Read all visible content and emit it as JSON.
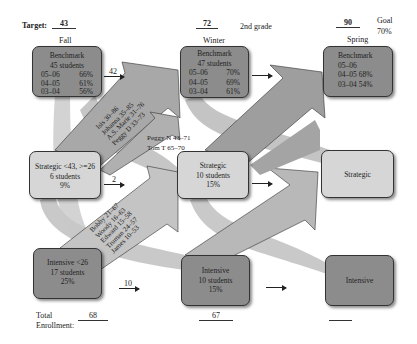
{
  "header": {
    "target_label": "Target:",
    "targets": {
      "fall": "43",
      "winter": "72",
      "spring": "90"
    },
    "grade": "2nd grade",
    "goal_label": "Goal",
    "goal_value": "70%"
  },
  "seasons": {
    "fall": "Fall",
    "winter": "Winter",
    "spring": "Spring"
  },
  "boxes": {
    "fall_benchmark": {
      "title": "Benchmark",
      "students": "45 students",
      "rows": [
        {
          "year": "05–06",
          "pct": "66%"
        },
        {
          "year": "04–05",
          "pct": "61%"
        },
        {
          "year": "03–04",
          "pct": "56%"
        }
      ]
    },
    "winter_benchmark": {
      "title": "Benchmark",
      "students": "47 students",
      "rows": [
        {
          "year": "05–06",
          "pct": "70%"
        },
        {
          "year": "04–05",
          "pct": "69%"
        },
        {
          "year": "03–04",
          "pct": "61%"
        }
      ]
    },
    "spring_benchmark": {
      "title": "Benchmark",
      "rows": [
        {
          "year": "05–06",
          "pct": ""
        },
        {
          "year": "04–05",
          "pct": "68%"
        },
        {
          "year": "03–04",
          "pct": "54%"
        }
      ]
    },
    "fall_strategic": {
      "title": "Strategic <43, >=26",
      "students": "6 students",
      "pct": "9%"
    },
    "winter_strategic": {
      "title": "Strategic",
      "students": "10 students",
      "pct": "15%"
    },
    "spring_strategic": {
      "title": "Strategic"
    },
    "fall_intensive": {
      "title": "Intensive <26",
      "students": "17 students",
      "pct": "25%"
    },
    "winter_intensive": {
      "title": "Intensive",
      "students": "10 students",
      "pct": "15%"
    },
    "spring_intensive": {
      "title": "Intensive"
    }
  },
  "flows": {
    "benchmark_stay": "42",
    "strategic_stay": "2",
    "intensive_stay": "10",
    "strategic_to_benchmark": [
      "Isis 30–86",
      "Johanna 35–85",
      "A.S. Marie 31–76",
      "Peggy D 33–73"
    ],
    "strategic_to_strategic": [
      "Peggy N 43–71",
      "Tom T 65–70"
    ],
    "intensive_to_strategic": [
      "Bobby 21–67",
      "Woody 16–63",
      "Edward 15–58",
      "Truman 24–57",
      "James 10–53"
    ]
  },
  "footer": {
    "total_label_1": "Total",
    "total_label_2": "Enrollment:",
    "fall_total": "68",
    "winter_total": "67",
    "spring_total": ""
  },
  "colors": {
    "dark_box": "#8c8c8c",
    "light_box": "#d6d6d6",
    "arrow": "#a9a9a9",
    "arrow_light": "#c4c4c4"
  }
}
